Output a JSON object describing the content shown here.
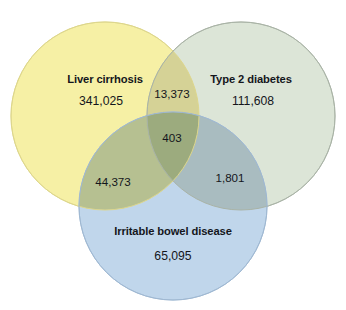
{
  "figure": {
    "type": "venn-3",
    "background_color": "#ffffff",
    "text_color": "#14161c"
  },
  "sets": [
    {
      "id": "liver-cirrhosis",
      "label": "Liver cirrhosis",
      "count": "341,025",
      "fill_color": "#F6F0A5",
      "stroke_color": "#E4DE93",
      "cx": 105,
      "cy": 116,
      "r": 94,
      "label_x": 105,
      "label_y": 79,
      "count_x": 101,
      "count_y": 101
    },
    {
      "id": "type-2-diabetes",
      "label": "Type 2 diabetes",
      "count": "111,608",
      "fill_color": "#DCE5D7",
      "stroke_color": "#B4BDB0",
      "cx": 241,
      "cy": 116,
      "r": 94,
      "label_x": 251,
      "label_y": 79,
      "count_x": 253,
      "count_y": 101
    },
    {
      "id": "irritable-bowel-disease",
      "label": "Irritable bowel disease",
      "count": "65,095",
      "fill_color": "#C0D6EB",
      "stroke_color": "#A6BFD8",
      "cx": 173,
      "cy": 206,
      "r": 94,
      "label_x": 173,
      "label_y": 231,
      "count_x": 173,
      "count_y": 256
    }
  ],
  "intersections": [
    {
      "id": "liver-diabetes",
      "sets": [
        "liver-cirrhosis",
        "type-2-diabetes"
      ],
      "count": "13,373",
      "fill_color": "#D5D296",
      "x": 172,
      "y": 93
    },
    {
      "id": "liver-diabetes-ibd",
      "sets": [
        "liver-cirrhosis",
        "type-2-diabetes",
        "irritable-bowel-disease"
      ],
      "count": "403",
      "fill_color": "#9CAB7E",
      "x": 172,
      "y": 137
    },
    {
      "id": "liver-ibd",
      "sets": [
        "liver-cirrhosis",
        "irritable-bowel-disease"
      ],
      "count": "44,373",
      "fill_color": "#B6C091",
      "x": 113,
      "y": 181
    },
    {
      "id": "diabetes-ibd",
      "sets": [
        "type-2-diabetes",
        "irritable-bowel-disease"
      ],
      "count": "1,801",
      "fill_color": "#A9BCC0",
      "x": 230,
      "y": 177
    }
  ]
}
